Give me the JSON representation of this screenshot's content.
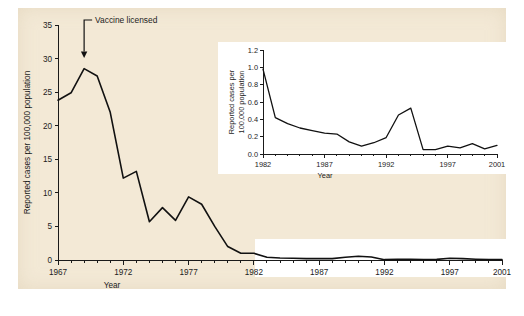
{
  "figure": {
    "background_color": "#f3e9d6",
    "page_color": "#ffffff",
    "line_color": "#111111"
  },
  "chart_data": [
    {
      "id": "main",
      "type": "line",
      "title": "",
      "xlabel": "Year",
      "ylabel": "Reported cases per 100,000 population",
      "xlim": [
        1967,
        2001
      ],
      "ylim": [
        0,
        35
      ],
      "xticks": [
        1967,
        1972,
        1977,
        1982,
        1987,
        1992,
        1997,
        2001
      ],
      "xticklabels": [
        "1967",
        "1972",
        "1977",
        "1982",
        "1987",
        "1992",
        "1997",
        "2001"
      ],
      "yticks": [
        0,
        5,
        10,
        15,
        20,
        25,
        30,
        35
      ],
      "yticklabels": [
        "0",
        "5",
        "10",
        "15",
        "20",
        "25",
        "30",
        "35"
      ],
      "minor_xticks": true,
      "grid": false,
      "legend": false,
      "x": [
        1967,
        1968,
        1969,
        1970,
        1971,
        1972,
        1973,
        1974,
        1975,
        1976,
        1977,
        1978,
        1979,
        1980,
        1981,
        1982,
        1983,
        1984,
        1985,
        1986,
        1987,
        1988,
        1989,
        1990,
        1991,
        1992,
        1993,
        1994,
        1995,
        1996,
        1997,
        1998,
        1999,
        2000,
        2001
      ],
      "values": [
        23.8,
        24.9,
        28.5,
        27.4,
        22.0,
        12.2,
        13.2,
        5.7,
        7.8,
        5.9,
        9.4,
        8.3,
        5.0,
        2.0,
        1.0,
        1.0,
        0.4,
        0.3,
        0.25,
        0.2,
        0.2,
        0.2,
        0.4,
        0.55,
        0.45,
        0.05,
        0.1,
        0.1,
        0.08,
        0.1,
        0.25,
        0.2,
        0.12,
        0.08,
        0.06
      ],
      "annotations": [
        {
          "text": "Vaccine licensed",
          "x": 1969,
          "y": 30,
          "arrow": "down"
        }
      ]
    },
    {
      "id": "inset",
      "type": "line",
      "title": "",
      "xlabel": "Year",
      "ylabel": "Reported cases per 100,000 population",
      "xlim": [
        1982,
        2001
      ],
      "ylim": [
        0.0,
        1.2
      ],
      "xticks": [
        1982,
        1987,
        1992,
        1997,
        2001
      ],
      "xticklabels": [
        "1982",
        "1987",
        "1992",
        "1997",
        "2001"
      ],
      "yticks": [
        0.0,
        0.2,
        0.4,
        0.6,
        0.8,
        1.0,
        1.2
      ],
      "yticklabels": [
        "0.0",
        "0.2",
        "0.4",
        "0.6",
        "0.8",
        "1.0",
        "1.2"
      ],
      "minor_xticks": true,
      "grid": false,
      "legend": false,
      "x": [
        1982,
        1983,
        1984,
        1985,
        1986,
        1987,
        1988,
        1989,
        1990,
        1991,
        1992,
        1993,
        1994,
        1995,
        1996,
        1997,
        1998,
        1999,
        2000,
        2001
      ],
      "values": [
        0.98,
        0.42,
        0.35,
        0.3,
        0.27,
        0.24,
        0.23,
        0.14,
        0.09,
        0.13,
        0.19,
        0.45,
        0.53,
        0.05,
        0.05,
        0.09,
        0.07,
        0.12,
        0.06,
        0.1
      ]
    }
  ],
  "main_chart": {
    "ylabel": "Reported cases per 100,000 population",
    "xlabel": "Year",
    "yticklabels": [
      "0",
      "5",
      "10",
      "15",
      "20",
      "25",
      "30",
      "35"
    ],
    "xticklabels": [
      "1967",
      "1972",
      "1977",
      "1982",
      "1987",
      "1992",
      "1997",
      "2001"
    ],
    "annotation_label": "Vaccine licensed"
  },
  "inset_chart": {
    "ylabel_line1": "Reported cases per",
    "ylabel_line2": "100,000 population",
    "xlabel": "Year",
    "yticklabels": [
      "0.0",
      "0.2",
      "0.4",
      "0.6",
      "0.8",
      "1.0",
      "1.2"
    ],
    "xticklabels": [
      "1982",
      "1987",
      "1992",
      "1997",
      "2001"
    ]
  }
}
